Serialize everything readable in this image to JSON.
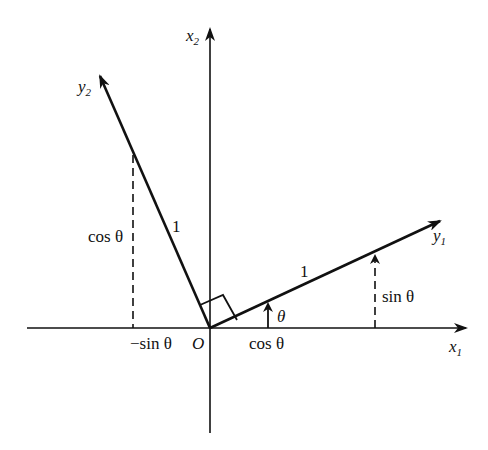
{
  "diagram": {
    "axes": {
      "x1": {
        "name": "x",
        "subscript": "1"
      },
      "x2": {
        "name": "x",
        "subscript": "2"
      },
      "y1": {
        "name": "y",
        "subscript": "1"
      },
      "y2": {
        "name": "y",
        "subscript": "2"
      }
    },
    "origin_label": "O",
    "angle_label": "θ",
    "unit_length_label_y1": "1",
    "unit_length_label_y2": "1",
    "projection_labels": {
      "cos_on_x1": "cos θ",
      "sin_on_x2": "sin θ",
      "neg_sin_on_x1": "−sin θ",
      "cos_on_x2": "cos θ"
    },
    "rotation_angle_degrees": 27,
    "colors": {
      "ink": "#111111",
      "background": "#ffffff"
    }
  }
}
